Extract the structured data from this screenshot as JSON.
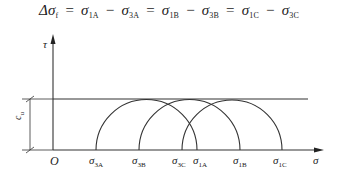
{
  "formula": {
    "lhs": "Δσ",
    "lhs_sub": "f",
    "terms": [
      {
        "sym": "σ",
        "sub": "1A"
      },
      {
        "sym": "σ",
        "sub": "3A"
      },
      {
        "sym": "σ",
        "sub": "1B"
      },
      {
        "sym": "σ",
        "sub": "3B"
      },
      {
        "sym": "σ",
        "sub": "1C"
      },
      {
        "sym": "σ",
        "sub": "3C"
      }
    ],
    "eq": "=",
    "minus": "−"
  },
  "axes": {
    "y_label": "τ",
    "x_label": "σ",
    "origin_label": "O"
  },
  "dimension": {
    "sym": "c",
    "sub": "u"
  },
  "ticks": [
    {
      "sym": "σ",
      "sub": "3A",
      "x": 96
    },
    {
      "sym": "σ",
      "sub": "3B",
      "x": 139
    },
    {
      "sym": "σ",
      "sub": "3C",
      "x": 182
    },
    {
      "sym": "σ",
      "sub": "1A",
      "x": 197
    },
    {
      "sym": "σ",
      "sub": "1B",
      "x": 240
    },
    {
      "sym": "σ",
      "sub": "1C",
      "x": 282
    }
  ],
  "circles": [
    {
      "name": "A",
      "sigma3": 96,
      "sigma1": 197
    },
    {
      "name": "B",
      "sigma3": 139,
      "sigma1": 240
    },
    {
      "name": "C",
      "sigma3": 182,
      "sigma1": 282
    }
  ],
  "colors": {
    "line": "#333333",
    "text": "#222222"
  }
}
